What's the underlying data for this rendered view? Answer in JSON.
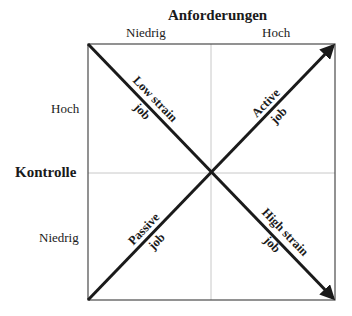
{
  "diagram": {
    "x_axis": {
      "title": "Anforderungen",
      "low_label": "Niedrig",
      "high_label": "Hoch"
    },
    "y_axis": {
      "title": "Kontrolle",
      "high_label": "Hoch",
      "low_label": "Niedrig"
    },
    "diagonals": [
      {
        "id": "low-strain",
        "line1": "Low strain",
        "line2": "job",
        "direction": "top-left to bottom-right (upper half)"
      },
      {
        "id": "active",
        "line1": "Active",
        "line2": "job",
        "direction": "toward top-right"
      },
      {
        "id": "passive",
        "line1": "Passive",
        "line2": "job",
        "direction": "bottom-left toward center"
      },
      {
        "id": "high-strain",
        "line1": "High strain",
        "line2": "job",
        "direction": "toward bottom-right"
      }
    ],
    "colors": {
      "line": "#1a1a1a",
      "grid": "#c8c8c8",
      "background": "#ffffff"
    }
  }
}
